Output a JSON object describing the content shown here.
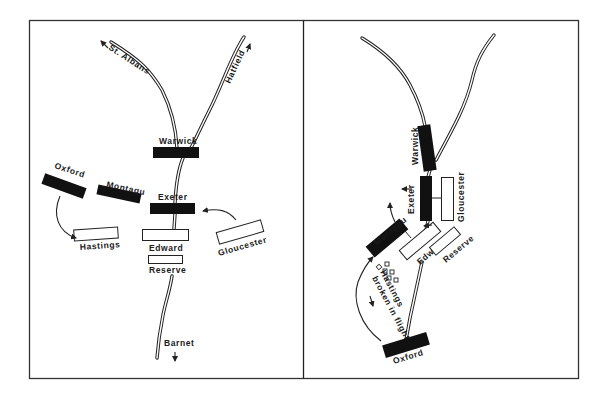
{
  "diagram": {
    "type": "battle-map",
    "panels": [
      {
        "id": "left",
        "roads": {
          "north_west": "St. Albans",
          "north_east": "Hatfield",
          "south": "Barnet"
        },
        "units": [
          {
            "name": "Warwick",
            "style": "solid"
          },
          {
            "name": "Exeter",
            "style": "solid"
          },
          {
            "name": "Montagu",
            "style": "solid"
          },
          {
            "name": "Oxford",
            "style": "solid"
          },
          {
            "name": "Hastings",
            "style": "hollow"
          },
          {
            "name": "Edward",
            "style": "hollow"
          },
          {
            "name": "Reserve",
            "style": "hollow"
          },
          {
            "name": "Gloucester",
            "style": "hollow"
          }
        ],
        "movements": [
          "Oxford -> Hastings",
          "Gloucester -> Exeter"
        ]
      },
      {
        "id": "right",
        "units": [
          {
            "name": "Warwick",
            "style": "solid"
          },
          {
            "name": "Exeter",
            "style": "solid"
          },
          {
            "name": "Montagu",
            "style": "solid"
          },
          {
            "name": "Oxford",
            "style": "solid"
          },
          {
            "name": "Gloucester",
            "style": "hollow"
          },
          {
            "name": "Edward",
            "style": "hollow"
          },
          {
            "name": "Reserve",
            "style": "hollow"
          }
        ],
        "annotations": {
          "hastings_line1": "Hastings",
          "hastings_line2": "broken in flight"
        },
        "movements": [
          "Oxford -> Montagu (curved)",
          "Exeter advancing west",
          "Montagu advancing north-west"
        ]
      }
    ],
    "labels": {
      "st_albans": "St. Albans",
      "hatfield": "Hatfield",
      "barnet": "Barnet",
      "warwick": "Warwick",
      "exeter": "Exeter",
      "montagu": "Montagu",
      "oxford": "Oxford",
      "hastings": "Hastings",
      "edward": "Edward",
      "reserve": "Reserve",
      "gloucester": "Gloucester",
      "hastings_broken_1": "Hastings",
      "hastings_broken_2": "broken in flight"
    },
    "colors": {
      "ink": "#111111",
      "paper": "#ffffff",
      "frame": "#333333"
    }
  }
}
